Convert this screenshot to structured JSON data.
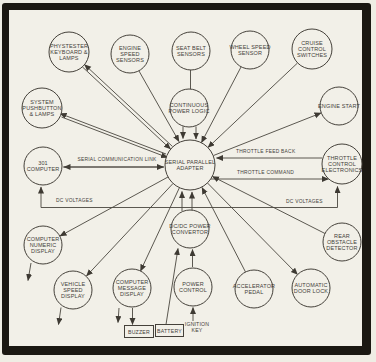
{
  "figure": {
    "nodes": {
      "phystester": "PHYSTESTER KEYBOARD & LAMPS",
      "engine_speed": "ENGINE SPEED SENSORS",
      "seat_belt": "SEAT BELT SENSORS",
      "wheel_speed": "WHEEL SPEED SENSOR",
      "cruise": "CRUISE CONTROL SWITCHES",
      "system_pushbutton": "SYSTEM PUSHBUTTON & LAMPS",
      "continuous_power_logic": "CONTINUOUS POWER LOGIC",
      "engine_start": "ENGINE START",
      "computer_301": "301 COMPUTER",
      "adapter": "SERIAL PARALLEL ADAPTER",
      "throttle_control": "THROTTLE CONTROL ELECTRONICS",
      "numeric_display": "COMPUTER NUMERIC DISPLAY",
      "convertor": "DC/DC POWER CONVERTOR",
      "rear_obstacle": "REAR OBSTACLE DETECTOR",
      "vehicle_speed": "VEHICLE SPEED DISPLAY",
      "message_display": "COMPUTER MESSAGE DISPLAY",
      "power_control": "POWER CONTROL",
      "accelerator": "ACCELERATOR PEDAL",
      "door_lock": "AUTOMATIC DOOR LOCK",
      "buzzer": "BUZZER",
      "battery": "BATTERY",
      "ignition_key": "IGNITION KEY"
    },
    "edge_labels": {
      "serial_link": "SERIAL COMMUNICATION LINK",
      "throttle_feedback": "THROTTLE FEED BACK",
      "throttle_command": "THROTTLE COMMAND",
      "dc_voltages_left": "DC VOLTAGES",
      "dc_voltages_right": "DC VOLTAGES"
    },
    "colors": {
      "ink": "#3e3a33",
      "line": "#4a463e",
      "paper": "#f2f0e8",
      "frame": "#1b1812"
    }
  }
}
